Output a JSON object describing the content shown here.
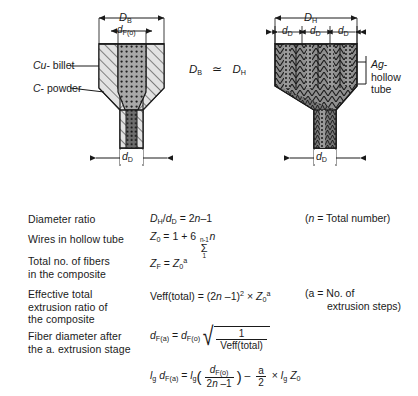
{
  "figure": {
    "left_diagram": {
      "name": "copper-billet-carbon-powder-billet",
      "top_dimension_label": "D",
      "top_dimension_sub": "B",
      "inner_dimension_label": "d",
      "inner_dimension_sub": "F(o)",
      "bottom_dimension_label": "d",
      "bottom_dimension_sub": "D",
      "callouts": [
        {
          "italic": "Cu",
          "rest": "- billet"
        },
        {
          "italic": "C",
          "rest": "- powder"
        }
      ]
    },
    "center_relation": {
      "left_symbol": "D",
      "left_sub": "B",
      "operator": "≃",
      "right_symbol": "D",
      "right_sub": "H"
    },
    "right_diagram": {
      "name": "silver-hollow-tube-assembly",
      "top_dimension_label": "D",
      "top_dimension_sub": "H",
      "segment_labels": [
        {
          "label": "d",
          "sub": "D"
        },
        {
          "label": "d",
          "sub": "D"
        },
        {
          "label": "d",
          "sub": "D"
        }
      ],
      "bottom_dimension_label": "d",
      "bottom_dimension_sub": "D",
      "callout": {
        "italic": "Ag",
        "line1": "-",
        "line2": "hollow",
        "line3": "tube"
      }
    }
  },
  "formulas": [
    {
      "label_lines": [
        "Diameter ratio"
      ],
      "equation_plain": "D_H/d_D = 2n–1",
      "note_lines": [
        "(n = Total number)"
      ]
    },
    {
      "label_lines": [
        "Wires in hollow tube"
      ],
      "equation_plain": "Z_0 = 1 + 6 Σ(1..n–1) n",
      "sum_upper": "n-1",
      "sum_lower": "1",
      "note_lines": []
    },
    {
      "label_lines": [
        "Total no. of fibers",
        "in the composite"
      ],
      "equation_plain": "Z_F = Z_0^a",
      "note_lines": []
    },
    {
      "label_lines": [
        "Effective total",
        "extrusion ratio of",
        "the composite"
      ],
      "equation_plain": "Veff(total) = (2n –1)² × Z_0^a",
      "veff_text": "Veff(total)",
      "note_lines": [
        "(a = No. of",
        "extrusion steps)"
      ]
    },
    {
      "label_lines": [
        "Fiber diameter after",
        "the a. extrusion stage"
      ],
      "equation_plain": "d_F(a) = d_F(o) √(1 / Veff(total))",
      "radicand_num": "1",
      "radicand_den": "Veff(total)",
      "note_lines": []
    },
    {
      "label_lines": [],
      "equation_plain": "lg d_F(a) = lg( d_F(o) / (2n –1) ) – (a/2) × lg Z_0",
      "note_lines": []
    }
  ],
  "symbols": {
    "d": "d",
    "D": "D",
    "Z": "Z",
    "V": "Veff(total)",
    "n": "n",
    "a": "a",
    "lg": "l",
    "lg_sub": "g",
    "sub_B": "B",
    "sub_H": "H",
    "sub_D": "D",
    "sub_F": "F",
    "sub_Fa": "F(a)",
    "sub_Fo": "F(o)",
    "sub_0": "0",
    "eq": "=",
    "times": "×",
    "minus": "–",
    "plus": "+",
    "one": "1",
    "two": "2",
    "six": "6",
    "two_n_minus_one": "2n–1",
    "slash": "/",
    "sigma": "Σ",
    "sup_a": "a",
    "sup_2": "2"
  },
  "colors": {
    "ink": "#1a1a1a",
    "cu_billet_fill": "#dcdcdc",
    "c_powder_fill": "#9e9e9e",
    "ag_tube_fill": "#8c8c8c",
    "core_dark": "#5a5a5a",
    "background": "#ffffff"
  }
}
